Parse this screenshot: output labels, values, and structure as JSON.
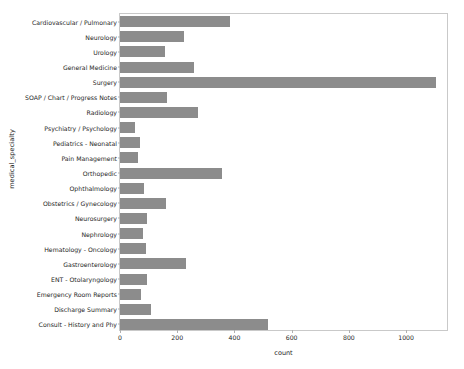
{
  "chart_data": {
    "type": "bar",
    "orientation": "horizontal",
    "title": "",
    "xlabel": "count",
    "ylabel": "medical_specialty",
    "xlim": [
      0,
      1150
    ],
    "ylim": [
      0,
      20
    ],
    "grid": false,
    "legend": null,
    "bar_color": "#8c8c8c",
    "xticks": [
      0,
      200,
      400,
      600,
      800,
      1000
    ],
    "xtick_labels": [
      "0",
      "200",
      "400",
      "600",
      "800",
      "1000"
    ],
    "categories": [
      "Cardiovascular / Pulmonary",
      "Neurology",
      "Urology",
      "General Medicine",
      "Surgery",
      "SOAP / Chart / Progress Notes",
      "Radiology",
      "Psychiatry / Psychology",
      "Pediatrics - Neonatal",
      "Pain Management",
      "Orthopedic",
      "Ophthalmology",
      "Obstetrics / Gynecology",
      "Neurosurgery",
      "Nephrology",
      "Hematology - Oncology",
      "Gastroenterology",
      "ENT - Otolaryngology",
      "Emergency Room Reports",
      "Discharge Summary",
      "Consult - History and Phy"
    ],
    "values": [
      386,
      223,
      156,
      259,
      1103,
      166,
      273,
      53,
      70,
      62,
      355,
      83,
      160,
      94,
      81,
      90,
      230,
      96,
      75,
      108,
      516
    ]
  }
}
